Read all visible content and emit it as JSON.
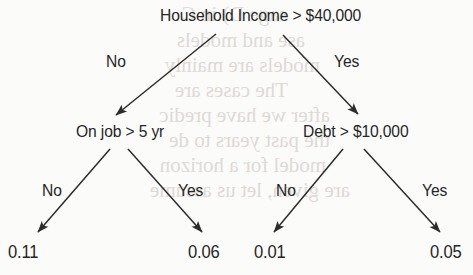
{
  "diagram": {
    "type": "decision-tree",
    "title_node": "Household Income > $40,000",
    "ink_color": "#262626",
    "background_color": "#fbfbfa",
    "bleed_color": "#dedad6"
  },
  "nodes": {
    "root": {
      "label": "Household Income > $40,000",
      "x": 160,
      "y": 6
    },
    "left_internal": {
      "label": "On job > 5 yr",
      "x": 76,
      "y": 122
    },
    "right_internal": {
      "label": "Debt > $10,000",
      "x": 303,
      "y": 122
    }
  },
  "edge_labels": {
    "root_no": {
      "label": "No",
      "x": 106,
      "y": 52
    },
    "root_yes": {
      "label": "Yes",
      "x": 334,
      "y": 52
    },
    "left_no": {
      "label": "No",
      "x": 42,
      "y": 181
    },
    "left_yes": {
      "label": "Yes",
      "x": 178,
      "y": 181
    },
    "right_no": {
      "label": "No",
      "x": 276,
      "y": 181
    },
    "right_yes": {
      "label": "Yes",
      "x": 422,
      "y": 181
    }
  },
  "leaves": [
    {
      "name": "leaf-left-no",
      "value": "0.11",
      "x": 8,
      "y": 242
    },
    {
      "name": "leaf-left-yes",
      "value": "0.06",
      "x": 188,
      "y": 242
    },
    {
      "name": "leaf-right-no",
      "value": "0.01",
      "x": 254,
      "y": 242
    },
    {
      "name": "leaf-right-yes",
      "value": "0.05",
      "x": 430,
      "y": 242
    }
  ],
  "edges": [
    {
      "name": "edge-root-to-left",
      "from": "root",
      "to": "left_internal",
      "label": "No",
      "x1": 216,
      "y1": 34,
      "x2": 114,
      "y2": 117
    },
    {
      "name": "edge-root-to-right",
      "from": "root",
      "to": "right_internal",
      "label": "Yes",
      "x1": 283,
      "y1": 35,
      "x2": 360,
      "y2": 116
    },
    {
      "name": "edge-left-to-leaf-no",
      "from": "left_internal",
      "to": "leaf-left-no",
      "label": "No",
      "x1": 110,
      "y1": 149,
      "x2": 36,
      "y2": 234
    },
    {
      "name": "edge-left-to-leaf-yes",
      "from": "left_internal",
      "to": "leaf-left-yes",
      "label": "Yes",
      "x1": 128,
      "y1": 149,
      "x2": 204,
      "y2": 234
    },
    {
      "name": "edge-right-to-leaf-no",
      "from": "right_internal",
      "to": "leaf-right-no",
      "label": "No",
      "x1": 343,
      "y1": 149,
      "x2": 272,
      "y2": 234
    },
    {
      "name": "edge-right-to-leaf-yes",
      "from": "right_internal",
      "to": "leaf-right-yes",
      "label": "Yes",
      "x1": 364,
      "y1": 149,
      "x2": 442,
      "y2": 234
    }
  ],
  "bleed_text": {
    "note": "faint mirrored show-through text from reverse side of page",
    "lines": [
      {
        "text": "sage D) in C",
        "x": 14,
        "y": 2,
        "size": 21
      },
      {
        "text": "ase and models",
        "x": 10,
        "y": 28,
        "size": 21
      },
      {
        "text": "models are mainly",
        "x": 8,
        "y": 53,
        "size": 21
      },
      {
        "text": "The cases are",
        "x": 14,
        "y": 78,
        "size": 21
      },
      {
        "text": "after we have predic",
        "x": 6,
        "y": 103,
        "size": 21
      },
      {
        "text": "the past years to de",
        "x": 6,
        "y": 128,
        "size": 21
      },
      {
        "text": "model for a horizon",
        "x": 8,
        "y": 153,
        "size": 21
      },
      {
        "text": "are given, let us assume",
        "x": 4,
        "y": 178,
        "size": 21
      }
    ]
  }
}
